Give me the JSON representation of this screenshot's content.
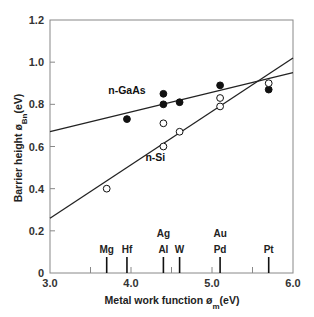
{
  "chart_data": {
    "type": "scatter",
    "title": "",
    "xlabel": "Metal work function",
    "xlabel_symbol": "ø",
    "xlabel_sub": "m",
    "xlabel_unit": "(eV)",
    "ylabel": "Barrier height",
    "ylabel_symbol": "ø",
    "ylabel_sub": "Bn",
    "ylabel_unit": "(eV)",
    "xlim": [
      3.0,
      6.0
    ],
    "ylim": [
      0,
      1.2
    ],
    "x_ticks": [
      {
        "value": 3.0,
        "label": "3.0"
      },
      {
        "value": 4.0,
        "label": "4.0"
      },
      {
        "value": 5.0,
        "label": "5.0"
      },
      {
        "value": 6.0,
        "label": "6.0"
      }
    ],
    "y_ticks": [
      {
        "value": 0,
        "label": "0"
      },
      {
        "value": 0.2,
        "label": "0.2"
      },
      {
        "value": 0.4,
        "label": "0.4"
      },
      {
        "value": 0.6,
        "label": "0.6"
      },
      {
        "value": 0.8,
        "label": "0.8"
      },
      {
        "value": 1.0,
        "label": "1.0"
      },
      {
        "value": 1.2,
        "label": "1.2"
      }
    ],
    "grid": false,
    "legend": "inline labels",
    "series": [
      {
        "name": "n-GaAs",
        "marker": "filled-circle",
        "points": [
          {
            "x": 3.95,
            "y": 0.73
          },
          {
            "x": 4.4,
            "y": 0.85
          },
          {
            "x": 4.4,
            "y": 0.8
          },
          {
            "x": 4.6,
            "y": 0.81
          },
          {
            "x": 5.1,
            "y": 0.89
          },
          {
            "x": 5.7,
            "y": 0.87
          }
        ],
        "fit_line": {
          "x": [
            3.0,
            6.0
          ],
          "y": [
            0.67,
            0.95
          ]
        },
        "label_pos": {
          "x": 3.95,
          "y": 0.85
        }
      },
      {
        "name": "n-Si",
        "marker": "open-circle",
        "points": [
          {
            "x": 3.7,
            "y": 0.4
          },
          {
            "x": 4.4,
            "y": 0.71
          },
          {
            "x": 4.4,
            "y": 0.6
          },
          {
            "x": 4.6,
            "y": 0.67
          },
          {
            "x": 5.1,
            "y": 0.83
          },
          {
            "x": 5.1,
            "y": 0.79
          },
          {
            "x": 5.7,
            "y": 0.9
          }
        ],
        "fit_line": {
          "x": [
            3.0,
            6.0
          ],
          "y": [
            0.26,
            1.02
          ]
        },
        "label_pos": {
          "x": 4.3,
          "y": 0.53
        }
      }
    ],
    "metals": [
      {
        "x": 3.7,
        "labels": [
          "Mg"
        ]
      },
      {
        "x": 3.95,
        "labels": [
          "Hf"
        ]
      },
      {
        "x": 4.4,
        "labels": [
          "Ag",
          "Al"
        ]
      },
      {
        "x": 4.6,
        "labels": [
          "W"
        ]
      },
      {
        "x": 5.1,
        "labels": [
          "Au",
          "Pd"
        ]
      },
      {
        "x": 5.7,
        "labels": [
          "Pt"
        ]
      }
    ],
    "minor_ticks": [
      3.5,
      4.0,
      4.5,
      5.0,
      5.5
    ]
  },
  "colors": {
    "axis": "#888888",
    "line": "#222222",
    "marker": "#111111"
  }
}
